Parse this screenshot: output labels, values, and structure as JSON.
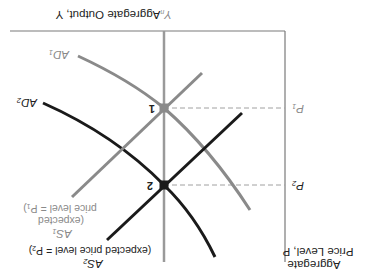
{
  "diagram": {
    "orientation": "upside-down",
    "axes": {
      "x_label": "Aggregate Output, Y",
      "y_label_line1": "Aggregate",
      "y_label_line2": "Price Level, P",
      "x_marker": "Y",
      "x_marker_sub": "n"
    },
    "price_levels": [
      {
        "label": "P",
        "sub": "1"
      },
      {
        "label": "P",
        "sub": "2"
      }
    ],
    "points": [
      {
        "label": "1"
      },
      {
        "label": "2"
      }
    ],
    "curves": {
      "ad1": {
        "label": "AD",
        "sub": "1",
        "color": "#8a8a8a"
      },
      "ad2": {
        "label": "AD",
        "sub": "2",
        "color": "#1a1a1a"
      },
      "as1": {
        "label": "AS",
        "sub": "1",
        "note_line1": "(expected",
        "note_line2": "price level = P",
        "note_sub": "1",
        "note_end": ")",
        "color": "#8a8a8a"
      },
      "as2": {
        "label": "AS",
        "sub": "2",
        "note_line1": "(expected price level = P",
        "note_sub": "2",
        "note_end": ")",
        "color": "#1a1a1a"
      }
    },
    "colors": {
      "axis": "#7a7a7a",
      "gray_curve": "#8a8a8a",
      "dark_curve": "#1a1a1a",
      "dashed": "#a0a0a0",
      "yn_line": "#9a9a9a"
    }
  }
}
